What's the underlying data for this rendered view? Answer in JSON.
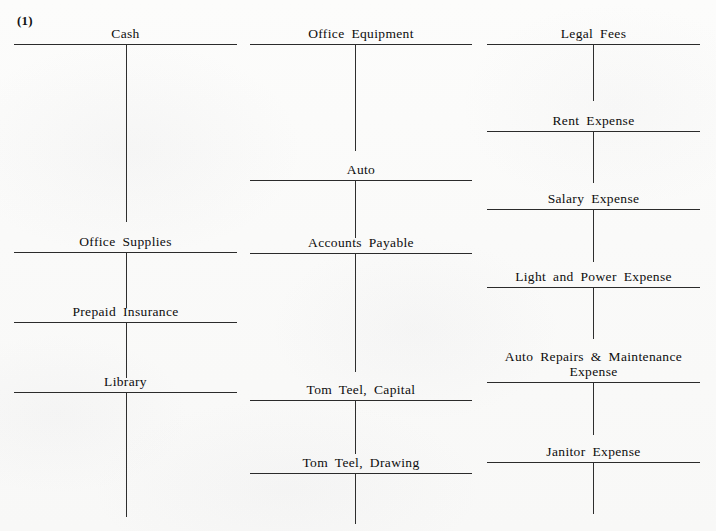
{
  "worksheet": {
    "problem_number": "(1)",
    "columns": [
      {
        "column_name": "left-column",
        "left": 14,
        "width": 223,
        "stem_offset": 112,
        "accounts": [
          {
            "name": "Cash",
            "rule_y": 44,
            "stem_height": 178,
            "title_lines": 1
          },
          {
            "name": "Office Supplies",
            "rule_y": 252,
            "stem_height": 56,
            "title_lines": 1
          },
          {
            "name": "Prepaid Insurance",
            "rule_y": 322,
            "stem_height": 56,
            "title_lines": 1
          },
          {
            "name": "Library",
            "rule_y": 392,
            "stem_height": 125,
            "title_lines": 1
          }
        ]
      },
      {
        "column_name": "middle-column",
        "left": 250,
        "width": 222,
        "stem_offset": 105,
        "accounts": [
          {
            "name": "Office Equipment",
            "rule_y": 44,
            "stem_height": 107,
            "title_lines": 1
          },
          {
            "name": "Auto",
            "rule_y": 180,
            "stem_height": 58,
            "title_lines": 1
          },
          {
            "name": "Accounts Payable",
            "rule_y": 253,
            "stem_height": 119,
            "title_lines": 1
          },
          {
            "name": "Tom Teel, Capital",
            "rule_y": 400,
            "stem_height": 54,
            "title_lines": 1
          },
          {
            "name": "Tom Teel, Drawing",
            "rule_y": 473,
            "stem_height": 51,
            "title_lines": 1
          }
        ]
      },
      {
        "column_name": "right-column",
        "left": 487,
        "width": 213,
        "stem_offset": 106,
        "accounts": [
          {
            "name": "Legal Fees",
            "rule_y": 44,
            "stem_height": 57,
            "title_lines": 1
          },
          {
            "name": "Rent Expense",
            "rule_y": 131,
            "stem_height": 52,
            "title_lines": 1
          },
          {
            "name": "Salary Expense",
            "rule_y": 209,
            "stem_height": 53,
            "title_lines": 1
          },
          {
            "name": "Light and Power Expense",
            "rule_y": 287,
            "stem_height": 52,
            "title_lines": 1
          },
          {
            "name": "Auto Repairs & Maintenance\nExpense",
            "rule_y": 382,
            "stem_height": 53,
            "title_lines": 2
          },
          {
            "name": "Janitor Expense",
            "rule_y": 462,
            "stem_height": 52,
            "title_lines": 1
          }
        ]
      }
    ]
  }
}
